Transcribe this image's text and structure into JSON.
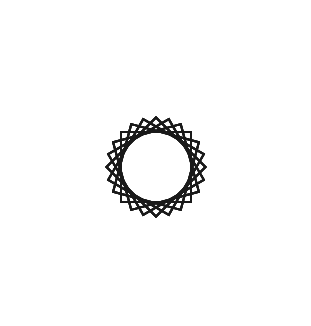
{
  "page": {
    "width": 311,
    "height": 326,
    "background_color": "#ffffff"
  },
  "figure": {
    "name": "spirograph-rosette",
    "stroke_color": "#1a1a1a",
    "fill": "none",
    "stroke_width": 2.0,
    "stroke_linejoin": "miter",
    "center_x": 156,
    "center_y": 167,
    "square_count": 24,
    "rotation_step_degrees": 15,
    "start_angle_degrees": 0,
    "square_half_side": 35,
    "corner_radius_outer": 138,
    "inner_envelope_radius": 89,
    "square_side_length": 70
  },
  "chart_data": {
    "type": "scatter",
    "title": "",
    "xlabel": "",
    "ylabel": "",
    "grid": false,
    "legend": null
  }
}
